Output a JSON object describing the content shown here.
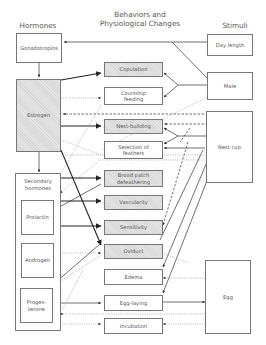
{
  "headers": {
    "hormones": "Hormones",
    "behaviors_line1": "Behaviors and",
    "behaviors_line2": "Physiological Changes",
    "stimuli": "Stimuli"
  },
  "hormones": {
    "gonadotropins": "Gonadotropins",
    "estrogen": "Estrogen",
    "secondary": "Secondary hormones",
    "prolactin": "Prolactin",
    "androgen": "Androgen",
    "progesterone": "Proges-terone"
  },
  "changes": {
    "copulation": "Copulation",
    "courtship_feeding": "Courtship feeding",
    "nest_building": "Nest-building",
    "selection_feathers": "Selection of feathers",
    "brood_patch": "Brood patch defeathering",
    "vascularity": "Vascularity",
    "sensitivity": "Sensitivity",
    "oviduct": "Oviduct",
    "edema": "Edema",
    "egg_laying": "Egg-laying",
    "incubation": "Incubation"
  },
  "stimuli": {
    "day_length": "Day length",
    "male": "Male",
    "nest_cup": "Nest cup",
    "egg": "Egg"
  },
  "colors": {
    "line": "#333333",
    "dotted": "#999999",
    "shaded_box": "#e4e4e4",
    "border": "#777777"
  }
}
